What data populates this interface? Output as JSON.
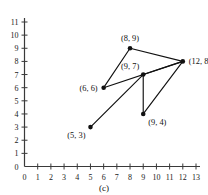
{
  "caption": "(c)",
  "colors": {
    "axis": "#3a3a3a",
    "edge": "#111111",
    "vertex": "#111111",
    "text": "#111111",
    "background": "#ffffff"
  },
  "chart_data": {
    "type": "scatter",
    "title": "",
    "subtitle": "",
    "xlabel": "",
    "ylabel": "",
    "xlim": [
      0,
      13
    ],
    "ylim": [
      0,
      11
    ],
    "grid": false,
    "legend": null,
    "x_ticks": [
      0,
      1,
      2,
      3,
      4,
      5,
      6,
      7,
      8,
      9,
      10,
      11,
      12,
      13
    ],
    "y_ticks": [
      0,
      1,
      2,
      3,
      4,
      5,
      6,
      7,
      8,
      9,
      10,
      11
    ],
    "x_tick_labels": [
      "0",
      "1",
      "2",
      "3",
      "4",
      "5",
      "6",
      "7",
      "8",
      "9",
      "10",
      "11",
      "12",
      "13"
    ],
    "y_tick_labels": [
      "0",
      "1",
      "2",
      "3",
      "4",
      "5",
      "6",
      "7",
      "8",
      "9",
      "10",
      "11"
    ],
    "annotation": "(c)",
    "points": [
      {
        "id": "p1",
        "x": 5,
        "y": 3,
        "label": "(5, 3)",
        "label_pos": "below-left"
      },
      {
        "id": "p2",
        "x": 6,
        "y": 6,
        "label": "(6, 6)",
        "label_pos": "left"
      },
      {
        "id": "p3",
        "x": 8,
        "y": 9,
        "label": "(8, 9)",
        "label_pos": "above"
      },
      {
        "id": "p4",
        "x": 9,
        "y": 7,
        "label": "(9, 7)",
        "label_pos": "above-left"
      },
      {
        "id": "p5",
        "x": 9,
        "y": 4,
        "label": "(9, 4)",
        "label_pos": "below-right"
      },
      {
        "id": "p6",
        "x": 12,
        "y": 8,
        "label": "(12, 8)",
        "label_pos": "right"
      }
    ],
    "edges": [
      {
        "from": "p2",
        "to": "p3"
      },
      {
        "from": "p3",
        "to": "p6"
      },
      {
        "from": "p2",
        "to": "p6"
      },
      {
        "from": "p4",
        "to": "p6"
      },
      {
        "from": "p1",
        "to": "p4"
      },
      {
        "from": "p4",
        "to": "p5"
      },
      {
        "from": "p5",
        "to": "p6"
      }
    ]
  }
}
